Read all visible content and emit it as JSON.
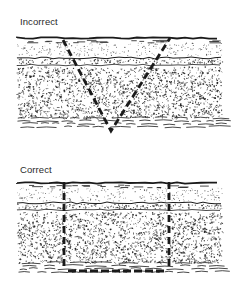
{
  "figure": {
    "panels": [
      {
        "label": "Incorrect",
        "excavation_shape": "v-cut",
        "description": "V-shaped sloped excavation"
      },
      {
        "label": "Correct",
        "excavation_shape": "rectangular-cut",
        "description": "Vertical-sided rectangular excavation"
      }
    ],
    "layers": [
      "surface",
      "fine-sand",
      "gravel-band",
      "coarse-soil",
      "subsoil-strata"
    ],
    "colors": {
      "ink": "#1a1a1a",
      "background": "#ffffff",
      "label": "#2a2a2a"
    }
  }
}
